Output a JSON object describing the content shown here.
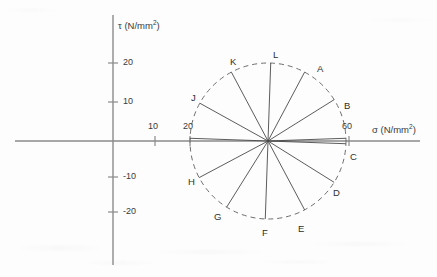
{
  "figure": {
    "type": "diagram",
    "title": "",
    "geometry": {
      "center_x": 268,
      "center_y": 141,
      "radius": 78
    },
    "axes": {
      "x": {
        "label": "σ (N/mm",
        "label_sup": "2",
        "label_close": ")",
        "line": {
          "x1": 15,
          "x2": 420,
          "y": 141
        },
        "ticks": [
          {
            "value": "10",
            "x": 155
          },
          {
            "value": "20",
            "x": 190
          },
          {
            "value": "60",
            "x": 349
          }
        ]
      },
      "y": {
        "label": "τ (N/mm",
        "label_sup": "2",
        "label_close": ")",
        "line": {
          "x": 113,
          "y1": 15,
          "y2": 265
        },
        "ticks": [
          {
            "value": "20",
            "y": 63
          },
          {
            "value": "10",
            "y": 102
          },
          {
            "value": "-10",
            "y": 177
          },
          {
            "value": "-20",
            "y": 212
          }
        ]
      }
    },
    "circle": {
      "style": "dashed",
      "color": "#6d6d6d"
    },
    "points": [
      {
        "id": "A",
        "angle_deg": 62,
        "label_x": 317,
        "label_y": 64
      },
      {
        "id": "B",
        "angle_deg": 32,
        "label_x": 344,
        "label_y": 101
      },
      {
        "id": "C",
        "angle_deg": 2,
        "label_x": 350,
        "label_y": 152
      },
      {
        "id": "D",
        "angle_deg": -32,
        "label_x": 333,
        "label_y": 188
      },
      {
        "id": "E",
        "angle_deg": -62,
        "label_x": 298,
        "label_y": 224
      },
      {
        "id": "F",
        "angle_deg": -92,
        "label_x": 262,
        "label_y": 228
      },
      {
        "id": "G",
        "angle_deg": -122,
        "label_x": 214,
        "label_y": 212
      },
      {
        "id": "H",
        "angle_deg": -152,
        "label_x": 188,
        "label_y": 177
      },
      {
        "id": "J",
        "angle_deg": 151,
        "label_x": 191,
        "label_y": 93
      },
      {
        "id": "K",
        "angle_deg": 118,
        "label_x": 230,
        "label_y": 57
      },
      {
        "id": "L",
        "angle_deg": 88,
        "label_x": 273,
        "label_y": 50
      }
    ],
    "extra_radii": [
      {
        "angle_deg": 178
      },
      {
        "angle_deg": -2
      }
    ]
  }
}
